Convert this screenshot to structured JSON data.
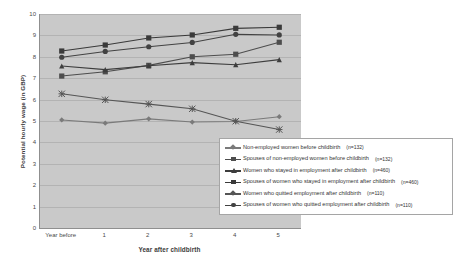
{
  "chart_data": {
    "type": "line",
    "title": "",
    "xlabel": "Year after childbirth",
    "ylabel": "Potential hourly wage (in GBP)",
    "categories": [
      "Year before",
      "1",
      "2",
      "3",
      "4",
      "5"
    ],
    "ylim": [
      0,
      10
    ],
    "ytick_step": 1,
    "yticks": [
      "10",
      "9",
      "8",
      "7",
      "6",
      "5",
      "4",
      "3",
      "2",
      "1",
      "0"
    ],
    "grid": true,
    "legend_position": "inside-bottom-right",
    "plot_background": "#c9c9c9",
    "series": [
      {
        "name": "Non-employed women before childbirth",
        "n_label": "(n=132)",
        "marker": "diamond",
        "color": "#7a7a7a",
        "values": [
          5.05,
          4.9,
          5.1,
          4.95,
          4.98,
          5.2
        ]
      },
      {
        "name": "Spouses of non-employed women before childbirth",
        "n_label": "(n=132)",
        "marker": "square",
        "color": "#4d4d4d",
        "values": [
          7.1,
          7.3,
          7.6,
          8.0,
          8.12,
          8.68
        ]
      },
      {
        "name": "Women who stayed in employment after childbirth",
        "n_label": "(n=460)",
        "marker": "triangle",
        "color": "#3d3d3d",
        "values": [
          7.57,
          7.4,
          7.58,
          7.73,
          7.63,
          7.87
        ]
      },
      {
        "name": "Spouses of women who stayed in employment after childbirth",
        "n_label": "(n=460)",
        "marker": "square",
        "color": "#3a3a3a",
        "values": [
          8.27,
          8.55,
          8.88,
          9.02,
          9.33,
          9.38
        ]
      },
      {
        "name": "Women who quitted employment after childbirth",
        "n_label": "(n=110)",
        "marker": "star",
        "color": "#555555",
        "values": [
          6.27,
          5.99,
          5.79,
          5.57,
          4.99,
          4.6
        ]
      },
      {
        "name": "Spouses of women who quitted employment after childbirth",
        "n_label": "(n=110)",
        "marker": "circle",
        "color": "#424242",
        "values": [
          7.98,
          8.25,
          8.47,
          8.67,
          9.05,
          9.02
        ]
      }
    ]
  }
}
